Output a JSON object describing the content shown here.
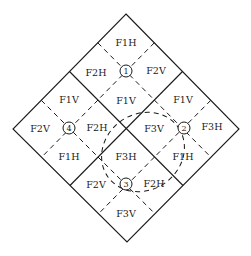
{
  "diagram": {
    "stroke_color": "#1a1a1a",
    "background": "#ffffff",
    "regions": {
      "top": {
        "marker": "1",
        "labels": {
          "top": "F1H",
          "left": "F2H",
          "right": "F2V",
          "bottom": "F1V"
        }
      },
      "left": {
        "marker": "4",
        "labels": {
          "top": "F1V",
          "left": "F2V",
          "right": "F2H",
          "bottom": "F1H"
        }
      },
      "right": {
        "marker": "2",
        "labels": {
          "top": "F1V",
          "left": "F3V",
          "right": "F3H",
          "bottom": "F1H"
        }
      },
      "bottom": {
        "marker": "3",
        "labels": {
          "top": "F3H",
          "left": "F2V",
          "right": "F2H",
          "bottom": "F3V"
        }
      }
    },
    "dashed_ellipse": "encloses F3V and F3H near center"
  }
}
